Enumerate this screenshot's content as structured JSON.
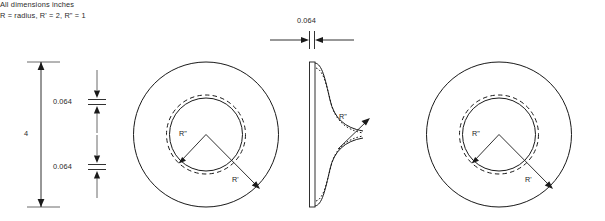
{
  "drawing": {
    "notes": {
      "line1": "All dimensions inches",
      "line2": "R = radius, R' = 2, R\" = 1"
    },
    "dimensions": {
      "overall_diameter": "4",
      "thickness_top_left": "0.064",
      "thickness_bottom_left": "0.064",
      "plate_thickness": "0.064"
    },
    "views": {
      "left_front": {
        "name": "front-view-left",
        "radius_outer_label": "R'",
        "radius_inner_label": "R\"",
        "outer_radius_value": 2,
        "inner_radius_value": 1
      },
      "middle_section": {
        "name": "section-view-middle",
        "radius_label": "R\""
      },
      "right_front": {
        "name": "front-view-right",
        "radius_outer_label": "R'",
        "radius_inner_label": "R\"",
        "outer_radius_value": 2,
        "inner_radius_value": 1
      }
    },
    "colors": {
      "line": "#1a1a1a",
      "text": "#2b2b2b",
      "background": "#ffffff"
    }
  }
}
